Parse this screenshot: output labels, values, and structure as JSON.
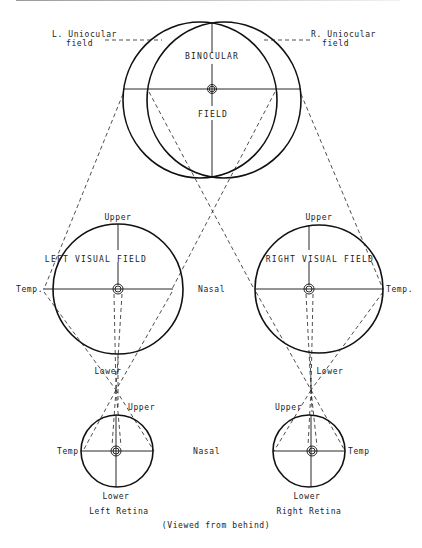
{
  "figure": {
    "caption": "(Viewed from behind)"
  },
  "binocular": {
    "left_uniocular_label_line1": "L. Uniocular",
    "left_uniocular_label_line2": "field",
    "right_uniocular_label_line1": "R. Uniocular",
    "right_uniocular_label_line2": "field",
    "binocular_label": "BINOCULAR",
    "field_label": "FIELD"
  },
  "left_visual_field": {
    "title": "LEFT VISUAL FIELD",
    "upper": "Upper",
    "lower": "Lower",
    "temporal": "Temp.",
    "nasal": "Nasal"
  },
  "right_visual_field": {
    "title": "RIGHT VISUAL FIELD",
    "upper": "Upper",
    "lower": "Lower",
    "temporal": "Temp."
  },
  "left_retina": {
    "name": "Left Retina",
    "upper": "Upper",
    "lower": "Lower",
    "temporal": "Temp",
    "nasal": "Nasal"
  },
  "right_retina": {
    "name": "Right Retina",
    "upper": "Upper",
    "lower": "Lower",
    "temporal": "Temp"
  },
  "colors": {
    "line": "#111111",
    "background": "#ffffff"
  }
}
